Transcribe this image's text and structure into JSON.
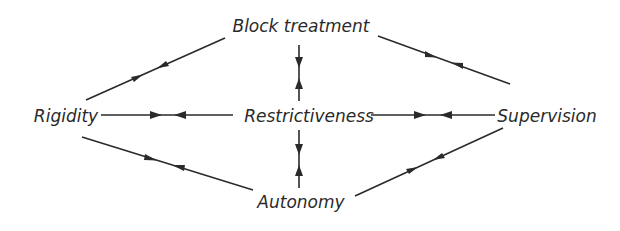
{
  "diagram": {
    "type": "concept-relationship-diagram",
    "nodes": [
      {
        "id": "block_treatment",
        "label": "Block treatment",
        "x": 301,
        "y": 32
      },
      {
        "id": "rigidity",
        "label": "Rigidity",
        "x": 66,
        "y": 122
      },
      {
        "id": "restrictiveness",
        "label": "Restrictiveness",
        "x": 309,
        "y": 122
      },
      {
        "id": "supervision",
        "label": "Supervision",
        "x": 547,
        "y": 122
      },
      {
        "id": "autonomy",
        "label": "Autonomy",
        "x": 301,
        "y": 208
      }
    ],
    "edges": [
      {
        "from": "rigidity",
        "to": "block_treatment",
        "style": "converging-arrows"
      },
      {
        "from": "block_treatment",
        "to": "supervision",
        "style": "converging-arrows"
      },
      {
        "from": "block_treatment",
        "to": "restrictiveness",
        "style": "converging-arrows"
      },
      {
        "from": "rigidity",
        "to": "restrictiveness",
        "style": "converging-arrows"
      },
      {
        "from": "restrictiveness",
        "to": "supervision",
        "style": "converging-arrows"
      },
      {
        "from": "restrictiveness",
        "to": "autonomy",
        "style": "converging-arrows"
      },
      {
        "from": "rigidity",
        "to": "autonomy",
        "style": "converging-arrows"
      },
      {
        "from": "autonomy",
        "to": "supervision",
        "style": "converging-arrows"
      }
    ],
    "colors": {
      "ink": "#2a2a2a",
      "background": "#ffffff"
    }
  }
}
